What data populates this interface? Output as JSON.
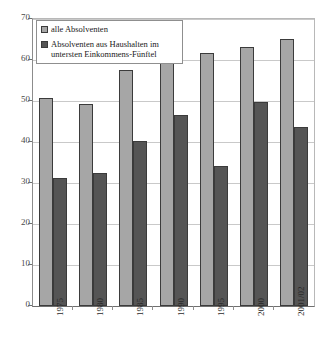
{
  "chart_data": {
    "type": "bar",
    "title": "",
    "subtitle": "",
    "xlabel": "",
    "ylabel": "",
    "categories": [
      "1975",
      "1980",
      "1985",
      "1990",
      "1995",
      "2000",
      "2001/02"
    ],
    "series": [
      {
        "name": "alle Absolventen",
        "color": "#a6a6a6",
        "values": [
          50.7,
          49.3,
          57.6,
          60.1,
          61.7,
          63.2,
          65.2
        ]
      },
      {
        "name": "Absolventen aus Haushalten im untersten Einkommens-Fünftel",
        "color": "#555555",
        "values": [
          31.2,
          32.4,
          40.2,
          46.6,
          34.2,
          49.7,
          43.7
        ]
      }
    ],
    "ylim": [
      0,
      70
    ],
    "yticks": [
      0,
      10,
      20,
      30,
      40,
      50,
      60,
      70
    ],
    "ytick_labels": [
      "0",
      "10",
      "20",
      "30",
      "40",
      "50",
      "60",
      "70"
    ],
    "grid": true,
    "grid_axis": "y",
    "legend_position": "top-left",
    "xtick_rotation": -90
  },
  "legend": {
    "entries": [
      {
        "label": "alle Absolventen",
        "swatch": "light"
      },
      {
        "label": "Absolventen aus Haushalten im untersten Einkommens-Fünftel",
        "swatch": "dark"
      }
    ]
  },
  "colors": {
    "series_light": "#a6a6a6",
    "series_dark": "#555555",
    "gridline": "#c9c9c9",
    "axis": "#6f6f6f",
    "background": "#ffffff"
  }
}
